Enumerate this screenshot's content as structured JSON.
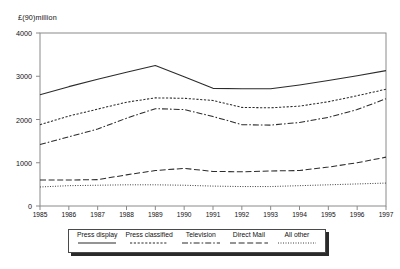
{
  "chart_data": {
    "type": "line",
    "title": "",
    "subtitle": "",
    "xlabel": "",
    "ylabel": "£(90)million",
    "ylim": [
      0,
      4000
    ],
    "yticks": [
      0,
      1000,
      2000,
      3000,
      4000
    ],
    "ytick_labels": [
      "0",
      "1000",
      "2000",
      "3000",
      "4000"
    ],
    "grid": false,
    "legend_position": "bottom",
    "categories": [
      "1985",
      "1986",
      "1987",
      "1988",
      "1989",
      "1990",
      "1991",
      "1992",
      "1993",
      "1994",
      "1995",
      "1996",
      "1997"
    ],
    "x": [
      1985,
      1986,
      1987,
      1988,
      1989,
      1990,
      1991,
      1992,
      1993,
      1994,
      1995,
      1996,
      1997
    ],
    "series": [
      {
        "name": "Press display",
        "style": "solid",
        "values": [
          2570,
          2760,
          2930,
          3090,
          3250,
          2990,
          2720,
          2710,
          2710,
          2800,
          2900,
          3010,
          3130
        ]
      },
      {
        "name": "Press classified",
        "style": "dotted",
        "values": [
          1880,
          2080,
          2240,
          2400,
          2500,
          2490,
          2440,
          2280,
          2270,
          2310,
          2410,
          2550,
          2700
        ]
      },
      {
        "name": "Television",
        "style": "dash-dot",
        "values": [
          1420,
          1600,
          1780,
          2030,
          2250,
          2230,
          2070,
          1880,
          1870,
          1930,
          2050,
          2230,
          2480
        ]
      },
      {
        "name": "Direct Mail",
        "style": "dashed",
        "values": [
          600,
          600,
          610,
          720,
          820,
          870,
          800,
          790,
          810,
          820,
          900,
          1000,
          1130
        ]
      },
      {
        "name": "All other",
        "style": "fine-dotted",
        "values": [
          440,
          470,
          480,
          490,
          490,
          480,
          460,
          450,
          450,
          470,
          490,
          510,
          530
        ]
      }
    ]
  },
  "legend": {
    "items": [
      {
        "label": "Press display"
      },
      {
        "label": "Press classified"
      },
      {
        "label": "Television"
      },
      {
        "label": "Direct Mail"
      },
      {
        "label": "All other"
      }
    ]
  }
}
